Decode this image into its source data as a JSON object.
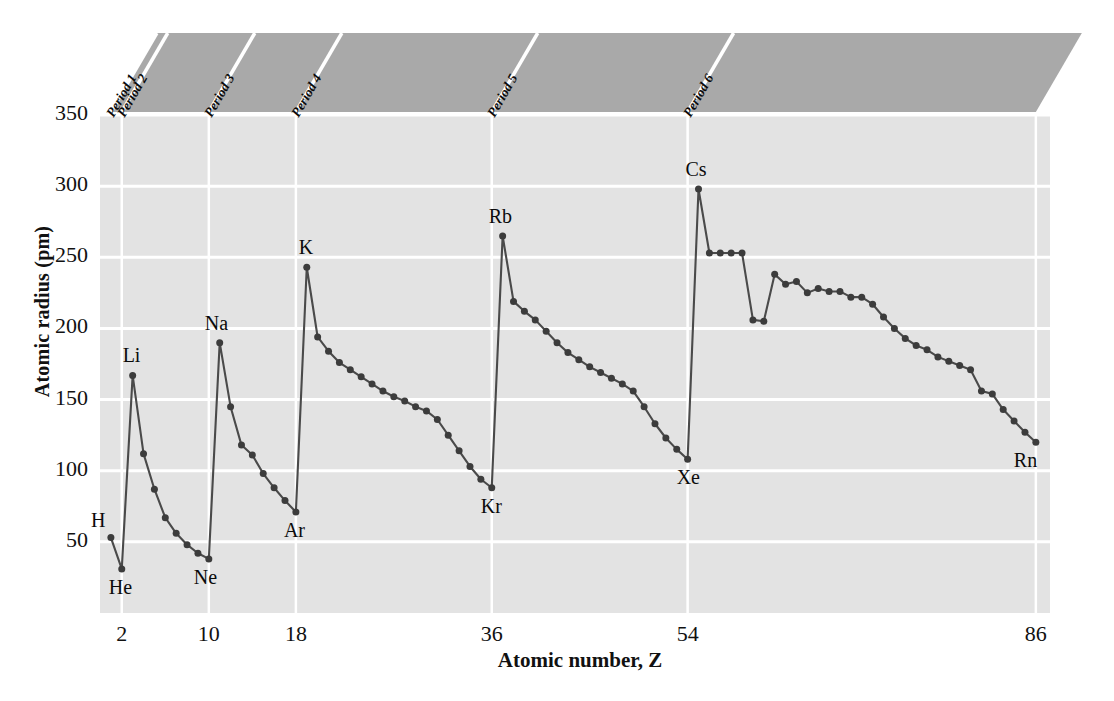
{
  "chart_data": {
    "type": "line",
    "title": "",
    "xlabel": "Atomic number, Z",
    "ylabel": "Atomic radius (pm)",
    "xlim": [
      0,
      88
    ],
    "ylim": [
      0,
      350
    ],
    "xticks": [
      2,
      10,
      18,
      36,
      54,
      86
    ],
    "yticks": [
      50,
      100,
      150,
      200,
      250,
      300,
      350
    ],
    "grid": true,
    "legend": "none",
    "series_name": "Atomic radius",
    "x": [
      1,
      2,
      3,
      4,
      5,
      6,
      7,
      8,
      9,
      10,
      11,
      12,
      13,
      14,
      15,
      16,
      17,
      18,
      19,
      20,
      21,
      22,
      23,
      24,
      25,
      26,
      27,
      28,
      29,
      30,
      31,
      32,
      33,
      34,
      35,
      36,
      37,
      38,
      39,
      40,
      41,
      42,
      43,
      44,
      45,
      46,
      47,
      48,
      49,
      50,
      51,
      52,
      53,
      54,
      55,
      56,
      57,
      58,
      59,
      60,
      61,
      62,
      63,
      64,
      65,
      66,
      67,
      68,
      69,
      70,
      71,
      72,
      73,
      74,
      75,
      76,
      77,
      78,
      79,
      80,
      81,
      82,
      83,
      84,
      85,
      86
    ],
    "y": [
      53,
      31,
      167,
      112,
      87,
      67,
      56,
      48,
      42,
      38,
      190,
      145,
      118,
      111,
      98,
      88,
      79,
      71,
      243,
      194,
      184,
      176,
      171,
      166,
      161,
      156,
      152,
      149,
      145,
      142,
      136,
      125,
      114,
      103,
      94,
      88,
      265,
      219,
      212,
      206,
      198,
      190,
      183,
      178,
      173,
      169,
      165,
      161,
      156,
      145,
      133,
      123,
      115,
      108,
      298,
      253,
      253,
      253,
      253,
      206,
      205,
      238,
      231,
      233,
      225,
      228,
      226,
      226,
      222,
      222,
      217,
      208,
      200,
      193,
      188,
      185,
      180,
      177,
      174,
      171,
      156,
      154,
      143,
      135,
      127,
      120
    ],
    "point_labels": [
      {
        "symbol": "H",
        "z": 1,
        "r": 53,
        "pos": "left-above"
      },
      {
        "symbol": "He",
        "z": 2,
        "r": 31,
        "pos": "below"
      },
      {
        "symbol": "Li",
        "z": 3,
        "r": 167,
        "pos": "above"
      },
      {
        "symbol": "Ne",
        "z": 10,
        "r": 38,
        "pos": "below"
      },
      {
        "symbol": "Na",
        "z": 11,
        "r": 190,
        "pos": "above"
      },
      {
        "symbol": "Ar",
        "z": 18,
        "r": 71,
        "pos": "below"
      },
      {
        "symbol": "K",
        "z": 19,
        "r": 243,
        "pos": "above"
      },
      {
        "symbol": "Kr",
        "z": 36,
        "r": 88,
        "pos": "below"
      },
      {
        "symbol": "Rb",
        "z": 37,
        "r": 265,
        "pos": "above"
      },
      {
        "symbol": "Xe",
        "z": 54,
        "r": 108,
        "pos": "below"
      },
      {
        "symbol": "Cs",
        "z": 55,
        "r": 298,
        "pos": "above"
      },
      {
        "symbol": "Rn",
        "z": 86,
        "r": 120,
        "pos": "below"
      }
    ],
    "period_bands": [
      {
        "label": "Period 1",
        "z_start": 1,
        "z_end": 2
      },
      {
        "label": "Period 2",
        "z_start": 2,
        "z_end": 10
      },
      {
        "label": "Period 3",
        "z_start": 10,
        "z_end": 18
      },
      {
        "label": "Period 4",
        "z_start": 18,
        "z_end": 36
      },
      {
        "label": "Period 5",
        "z_start": 36,
        "z_end": 54
      },
      {
        "label": "Period 6",
        "z_start": 54,
        "z_end": 86
      }
    ],
    "colors": {
      "plot_background": "#e3e3e3",
      "gridline": "#ffffff",
      "line": "#4a4a4a",
      "marker": "#3c3c3c",
      "band_fill": "#a9a9a9",
      "band_divider": "#ffffff",
      "text": "#111111",
      "page_background": "#ffffff"
    }
  }
}
